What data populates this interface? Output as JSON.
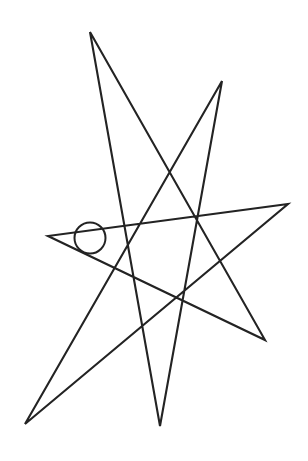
{
  "document": {
    "title": "Heptagram Line Drawing",
    "width": 308,
    "height": 461,
    "background_color": "#ffffff"
  },
  "figure": {
    "name": "seven-pointed-star-polygon",
    "ink_color": "#232323",
    "stroke_width": 2.1,
    "circle_stroke_width": 2.0,
    "point_count": 7,
    "step": 3,
    "tips": [
      {
        "name": "top-tip",
        "x": 90,
        "y": 32
      },
      {
        "name": "upper-right-tip",
        "x": 222,
        "y": 81
      },
      {
        "name": "right-tip",
        "x": 288,
        "y": 204
      },
      {
        "name": "lower-right-tip",
        "x": 265,
        "y": 340
      },
      {
        "name": "bottom-tip",
        "x": 160,
        "y": 426
      },
      {
        "name": "bottom-left-tip",
        "x": 25,
        "y": 424
      },
      {
        "name": "left-tip",
        "x": 48,
        "y": 236
      }
    ],
    "path_order": [
      0,
      3,
      6,
      2,
      5,
      1,
      4
    ],
    "path_d": "M 90 32 L 265 340 L 48 236 L 288 204 L 25 424 L 222 81 L 160 426 Z",
    "center_circle": {
      "name": "center-circle",
      "cx": 90,
      "cy": 238,
      "r": 15.5
    }
  },
  "chart_data": {
    "type": "line",
    "xlabel": "",
    "ylabel": "",
    "xlim": [
      0,
      308
    ],
    "ylim": [
      461,
      0
    ],
    "grid": false,
    "legend": "none",
    "series": [
      {
        "name": "star-polygon-outline",
        "closed": true,
        "x": [
          90,
          265,
          48,
          288,
          25,
          222,
          160,
          90
        ],
        "y": [
          32,
          340,
          236,
          204,
          424,
          81,
          426,
          32
        ]
      },
      {
        "name": "center-circle",
        "shape": "circle",
        "cx": 90,
        "cy": 238,
        "r": 15.5
      }
    ],
    "annotations": []
  }
}
